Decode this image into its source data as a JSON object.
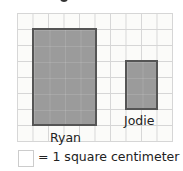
{
  "diagram": {
    "grid": {
      "columns": 10,
      "rows": 8,
      "line_color": "#d6d6d6"
    },
    "shapes": [
      {
        "name": "Ryan",
        "label": "Ryan",
        "width_units": 4,
        "height_units": 6,
        "fill": "#9b9b9b",
        "stroke": "#555555"
      },
      {
        "name": "Jodie",
        "label": "Jodie",
        "width_units": 2,
        "height_units": 3,
        "fill": "#9b9b9b",
        "stroke": "#555555"
      }
    ],
    "legend": {
      "text": "= 1 square centimeter"
    }
  }
}
